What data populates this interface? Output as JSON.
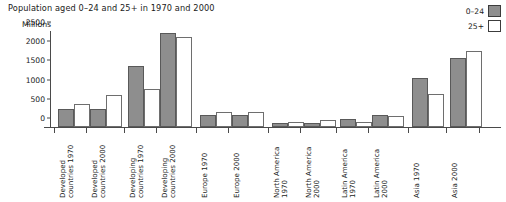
{
  "chart_data": {
    "type": "bar",
    "title": "Population aged 0–24 and 25+ in 1970 and 2000",
    "xlabel": "",
    "ylabel": "Millions",
    "ylim": [
      0,
      2500
    ],
    "yticks": [
      0,
      500,
      1000,
      1500,
      2000,
      2500
    ],
    "ytick_labels": [
      "0",
      "500",
      "1000",
      "1500",
      "2000",
      "2500"
    ],
    "grid": false,
    "legend_position": "top-right",
    "categories": [
      "Developed countries 1970",
      "Developed countries 2000",
      "Developing countries 1970",
      "Developing countries 2000",
      "Europe 1970",
      "Europe 2000",
      "North America 1970",
      "North America 2000",
      "Latin America 1970",
      "Latin America 2000",
      "Asia 1970",
      "Asia 2000"
    ],
    "series": [
      {
        "name": "0–24",
        "color": "#8e8e8e",
        "values": [
          460,
          480,
          1600,
          2450,
          310,
          300,
          115,
          105,
          210,
          300,
          1270,
          1800
        ]
      },
      {
        "name": "25+",
        "color": "#ffffff",
        "values": [
          610,
          845,
          990,
          2350,
          390,
          400,
          130,
          190,
          135,
          290,
          870,
          1980
        ]
      }
    ]
  },
  "legend": {
    "items": [
      {
        "label": "0–24",
        "swatch": "#8e8e8e"
      },
      {
        "label": "25+",
        "swatch": "#ffffff"
      }
    ]
  },
  "axis": {
    "y_title": "Millions"
  },
  "xlabels": [
    "Developed\ncountries 1970",
    "Developed\ncountries 2000",
    "Developing\ncountries 1970",
    "Developing\ncountries 2000",
    "Europe 1970",
    "Europe 2000",
    "North America\n1970",
    "North America\n2000",
    "Latin America\n1970",
    "Latin America\n2000",
    "Asia 1970",
    "Asia 2000"
  ]
}
